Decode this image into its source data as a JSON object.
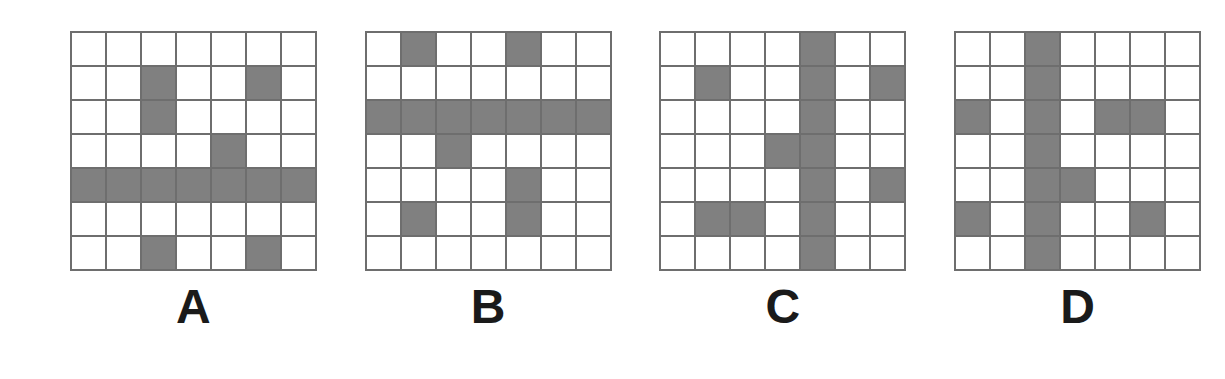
{
  "figure": {
    "type": "grid-pattern-comparison",
    "grid_rows": 7,
    "grid_cols": 7,
    "colors": {
      "filled_cell": "#808080",
      "empty_cell": "#ffffff",
      "grid_line": "#6e6e6e",
      "label_text": "#1a1a1a",
      "background": "#ffffff"
    },
    "panels": [
      {
        "label": "A",
        "cells": [
          [
            0,
            0,
            0,
            0,
            0,
            0,
            0
          ],
          [
            0,
            0,
            1,
            0,
            0,
            1,
            0
          ],
          [
            0,
            0,
            1,
            0,
            0,
            0,
            0
          ],
          [
            0,
            0,
            0,
            0,
            1,
            0,
            0
          ],
          [
            1,
            1,
            1,
            1,
            1,
            1,
            1
          ],
          [
            0,
            0,
            0,
            0,
            0,
            0,
            0
          ],
          [
            0,
            0,
            1,
            0,
            0,
            1,
            0
          ]
        ]
      },
      {
        "label": "B",
        "cells": [
          [
            0,
            1,
            0,
            0,
            1,
            0,
            0
          ],
          [
            0,
            0,
            0,
            0,
            0,
            0,
            0
          ],
          [
            1,
            1,
            1,
            1,
            1,
            1,
            1
          ],
          [
            0,
            0,
            1,
            0,
            0,
            0,
            0
          ],
          [
            0,
            0,
            0,
            0,
            1,
            0,
            0
          ],
          [
            0,
            1,
            0,
            0,
            1,
            0,
            0
          ],
          [
            0,
            0,
            0,
            0,
            0,
            0,
            0
          ]
        ]
      },
      {
        "label": "C",
        "cells": [
          [
            0,
            0,
            0,
            0,
            1,
            0,
            0
          ],
          [
            0,
            1,
            0,
            0,
            1,
            0,
            1
          ],
          [
            0,
            0,
            0,
            0,
            1,
            0,
            0
          ],
          [
            0,
            0,
            0,
            1,
            1,
            0,
            0
          ],
          [
            0,
            0,
            0,
            0,
            1,
            0,
            1
          ],
          [
            0,
            1,
            1,
            0,
            1,
            0,
            0
          ],
          [
            0,
            0,
            0,
            0,
            1,
            0,
            0
          ]
        ]
      },
      {
        "label": "D",
        "cells": [
          [
            0,
            0,
            1,
            0,
            0,
            0,
            0
          ],
          [
            0,
            0,
            1,
            0,
            0,
            0,
            0
          ],
          [
            1,
            0,
            1,
            0,
            1,
            1,
            0
          ],
          [
            0,
            0,
            1,
            0,
            0,
            0,
            0
          ],
          [
            0,
            0,
            1,
            1,
            0,
            0,
            0
          ],
          [
            1,
            0,
            1,
            0,
            0,
            1,
            0
          ],
          [
            0,
            0,
            1,
            0,
            0,
            0,
            0
          ]
        ]
      }
    ]
  }
}
